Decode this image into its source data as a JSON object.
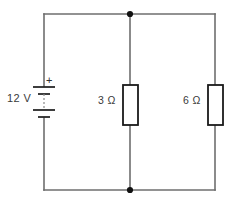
{
  "diagram": {
    "type": "electrical-schematic",
    "background_color": "#ffffff",
    "wire_color": "#6e6e6e",
    "component_outline_color": "#1a1a1a",
    "node_color": "#111111",
    "text_color": "#3a3a3a"
  },
  "source": {
    "name": "battery",
    "value": "12 V",
    "polarity_positive": "+",
    "position": "left-branch"
  },
  "components": [
    {
      "id": "r1",
      "name": "resistor",
      "value": "3 Ω",
      "position": "middle-branch"
    },
    {
      "id": "r2",
      "name": "resistor",
      "value": "6 Ω",
      "position": "right-branch"
    }
  ],
  "nodes": [
    {
      "id": "node-top",
      "x": 130,
      "y": 14
    },
    {
      "id": "node-bottom",
      "x": 130,
      "y": 190
    }
  ],
  "geometry": {
    "left_x": 44,
    "right_x": 215,
    "middle_x": 130,
    "top_y": 14,
    "bottom_y": 190
  }
}
